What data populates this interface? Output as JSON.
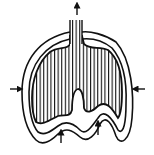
{
  "diagram": {
    "colors": {
      "stroke": "#111111",
      "background": "#ffffff"
    },
    "arrows": [
      {
        "name": "airflow-out-arrow",
        "direction": "up"
      },
      {
        "name": "chest-wall-left-arrow",
        "direction": "right"
      },
      {
        "name": "chest-wall-right-arrow",
        "direction": "left"
      },
      {
        "name": "diaphragm-left-arrow",
        "direction": "up"
      },
      {
        "name": "diaphragm-right-arrow",
        "direction": "up"
      }
    ],
    "labels": []
  }
}
